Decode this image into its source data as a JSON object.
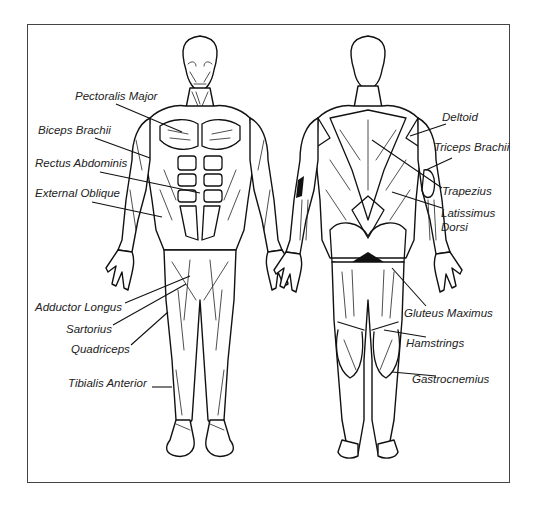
{
  "diagram": {
    "title": "",
    "views": [
      {
        "name": "front",
        "description": "Anterior view of human muscular system"
      },
      {
        "name": "back",
        "description": "Posterior view of human muscular system"
      }
    ],
    "labels": {
      "front": [
        {
          "text": "Pectoralis Major",
          "x": 75,
          "y": 90
        },
        {
          "text": "Biceps Brachii",
          "x": 38,
          "y": 124
        },
        {
          "text": "Rectus Abdominis",
          "x": 35,
          "y": 157
        },
        {
          "text": "External Oblique",
          "x": 35,
          "y": 187
        },
        {
          "text": "Adductor  Longus",
          "x": 35,
          "y": 301
        },
        {
          "text": "Sartorius",
          "x": 66,
          "y": 323
        },
        {
          "text": "Quadriceps",
          "x": 71,
          "y": 343
        },
        {
          "text": "Tibialis Anterior",
          "x": 68,
          "y": 377
        }
      ],
      "back": [
        {
          "text": "Deltoid",
          "x": 442,
          "y": 111
        },
        {
          "text": "Triceps Brachii",
          "x": 434,
          "y": 141
        },
        {
          "text": "Trapezius",
          "x": 442,
          "y": 185
        },
        {
          "text": "Latissimus",
          "x": 441,
          "y": 207
        },
        {
          "text": "Dorsi",
          "x": 441,
          "y": 221
        },
        {
          "text": "Gluteus  Maximus",
          "x": 404,
          "y": 307
        },
        {
          "text": "Hamstrings",
          "x": 406,
          "y": 337
        },
        {
          "text": "Gastrocnemius",
          "x": 412,
          "y": 373
        }
      ]
    }
  }
}
